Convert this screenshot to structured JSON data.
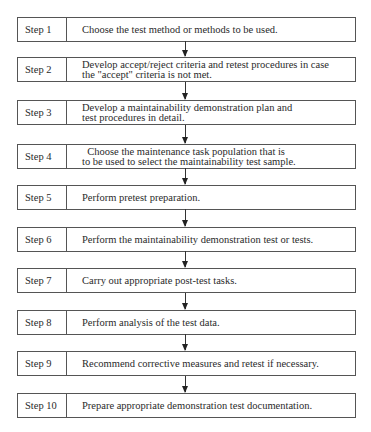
{
  "diagram": {
    "type": "vertical-flowchart",
    "steps": [
      {
        "label": "Step 1",
        "lines": [
          "Choose the test method or methods to be used."
        ]
      },
      {
        "label": "Step 2",
        "lines": [
          "Develop accept/reject criteria and retest procedures in case",
          "the \"accept\" criteria is not met."
        ]
      },
      {
        "label": "Step 3",
        "lines": [
          "Develop a maintainability demonstration plan and",
          "test procedures in detail."
        ]
      },
      {
        "label": "Step 4",
        "lines": [
          "  Choose the maintenance task population that is",
          "to be used to select the maintainability test sample."
        ]
      },
      {
        "label": "Step 5",
        "lines": [
          "Perform pretest preparation."
        ]
      },
      {
        "label": "Step 6",
        "lines": [
          "Perform the maintainability demonstration test or tests."
        ]
      },
      {
        "label": "Step 7",
        "lines": [
          "Carry out appropriate post-test tasks."
        ]
      },
      {
        "label": "Step 8",
        "lines": [
          "Perform analysis of the test data."
        ]
      },
      {
        "label": "Step 9",
        "lines": [
          "Recommend corrective measures and retest if necessary."
        ]
      },
      {
        "label": "Step 10",
        "lines": [
          "Prepare appropriate demonstration test documentation."
        ]
      }
    ],
    "colors": {
      "border": "#555555",
      "text": "#2a2a2a",
      "arrow": "#222222",
      "background": "#ffffff"
    }
  }
}
